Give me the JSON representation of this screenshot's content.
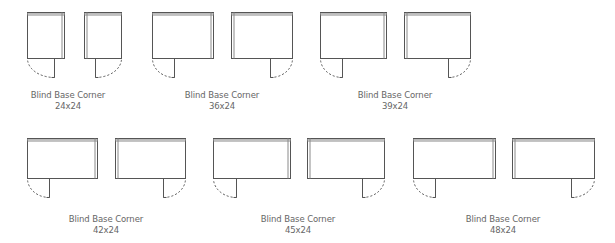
{
  "colors": {
    "line": "#555555",
    "thick": "#8a8a8a",
    "text": "#666666",
    "background": "#ffffff"
  },
  "groups": [
    {
      "name": "Blind Base Corner",
      "size": "24x24",
      "left": {
        "x": 27,
        "y": 12,
        "w": 37,
        "h": 46,
        "stem_x": 54
      },
      "right": {
        "x": 84,
        "y": 12,
        "w": 37,
        "h": 46,
        "stem_x": 95
      },
      "label_x": 68,
      "label_y": 90
    },
    {
      "name": "Blind Base Corner",
      "size": "36x24",
      "left": {
        "x": 152,
        "y": 12,
        "w": 61,
        "h": 46,
        "stem_x": 174
      },
      "right": {
        "x": 231,
        "y": 12,
        "w": 61,
        "h": 46,
        "stem_x": 270
      },
      "label_x": 222,
      "label_y": 90
    },
    {
      "name": "Blind Base Corner",
      "size": "39x24",
      "left": {
        "x": 320,
        "y": 12,
        "w": 66,
        "h": 46,
        "stem_x": 342
      },
      "right": {
        "x": 404,
        "y": 12,
        "w": 66,
        "h": 46,
        "stem_x": 448
      },
      "label_x": 395,
      "label_y": 90
    },
    {
      "name": "Blind Base Corner",
      "size": "42x24",
      "left": {
        "x": 27,
        "y": 138,
        "w": 70,
        "h": 40,
        "stem_x": 49
      },
      "right": {
        "x": 115,
        "y": 138,
        "w": 70,
        "h": 40,
        "stem_x": 163
      },
      "label_x": 106,
      "label_y": 214
    },
    {
      "name": "Blind Base Corner",
      "size": "45x24",
      "left": {
        "x": 213,
        "y": 138,
        "w": 77,
        "h": 40,
        "stem_x": 236
      },
      "right": {
        "x": 307,
        "y": 138,
        "w": 77,
        "h": 40,
        "stem_x": 362
      },
      "label_x": 298,
      "label_y": 214
    },
    {
      "name": "Blind Base Corner",
      "size": "48x24",
      "left": {
        "x": 413,
        "y": 138,
        "w": 82,
        "h": 40,
        "stem_x": 435
      },
      "right": {
        "x": 512,
        "y": 138,
        "w": 82,
        "h": 40,
        "stem_x": 571
      },
      "label_x": 503,
      "label_y": 214
    }
  ]
}
